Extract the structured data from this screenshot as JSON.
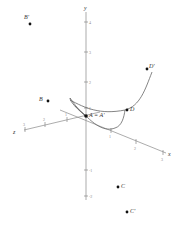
{
  "axes": {
    "x_label": "x",
    "y_label": "y",
    "z_label": "z",
    "y_ticks": [
      "4",
      "3",
      "2",
      "1",
      "-1",
      "-2"
    ],
    "x_ticks": [
      "1",
      "2",
      "3"
    ],
    "z_ticks": [
      "1",
      "2",
      "3"
    ]
  },
  "points": {
    "origin": "A = A'",
    "B": "B",
    "B_prime": "B'",
    "C": "C",
    "C_prime": "C'",
    "D": "D",
    "D_prime": "D'"
  },
  "colors": {
    "axis": "#888888",
    "curve": "#666666",
    "point": "#111111"
  }
}
